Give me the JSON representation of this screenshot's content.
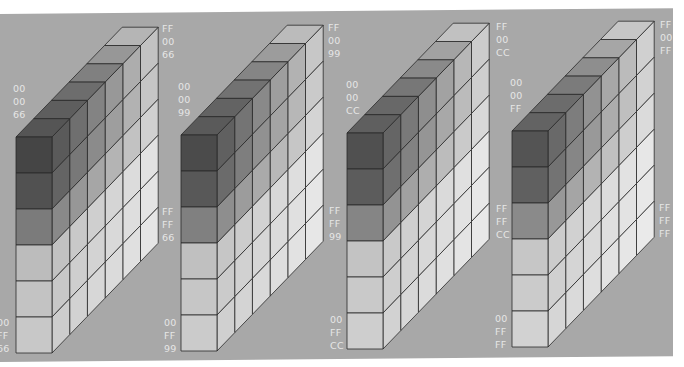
{
  "background_color": "#a8a8a8",
  "line_color": "#2a2a2a",
  "geometry": {
    "cell": 36,
    "rows": 6,
    "depth_steps": 6,
    "dx": 17.7,
    "dy": -18.3
  },
  "cubes": [
    {
      "id": "cube-66",
      "x": 16,
      "bottom": 353,
      "front": [
        "#454545",
        "#515151",
        "#7b7b7b",
        "#bcbcbc",
        "#c3c3c3",
        "#c8c8c8"
      ],
      "top": [
        "#555555",
        "#5e5e5e",
        "#6d6d6d",
        "#808080",
        "#979797",
        "#b5b5b5"
      ],
      "side_fade": 1.0,
      "labels": {
        "top_left": [
          "00",
          "00",
          "66"
        ],
        "top_left_pos": [
          13,
          92
        ],
        "top_right": [
          "FF",
          "00",
          "66"
        ],
        "top_right_pos": [
          162,
          32
        ],
        "mid_right": [
          "FF",
          "FF",
          "66"
        ],
        "mid_right_pos": [
          162,
          215
        ],
        "bottom_left": [
          "00",
          "FF",
          "66"
        ],
        "bottom_left_pos": [
          -3,
          326
        ]
      }
    },
    {
      "id": "cube-99",
      "x": 181,
      "bottom": 351,
      "front": [
        "#4b4b4b",
        "#585858",
        "#808080",
        "#c0c0c0",
        "#c6c6c6",
        "#cbcbcb"
      ],
      "top": [
        "#5a5a5a",
        "#636363",
        "#727272",
        "#858585",
        "#9c9c9c",
        "#bbbbbb"
      ],
      "side_fade": 1.03,
      "labels": {
        "top_left": [
          "00",
          "00",
          "99"
        ],
        "top_left_pos": [
          178,
          90
        ],
        "top_right": [
          "FF",
          "00",
          "99"
        ],
        "top_right_pos": [
          328,
          31
        ],
        "mid_right": [
          "FF",
          "FF",
          "99"
        ],
        "mid_right_pos": [
          329,
          214
        ],
        "bottom_left": [
          "00",
          "FF",
          "99"
        ],
        "bottom_left_pos": [
          164,
          326
        ]
      }
    },
    {
      "id": "cube-cc",
      "x": 347,
      "bottom": 349,
      "front": [
        "#505050",
        "#5c5c5c",
        "#858585",
        "#c3c3c3",
        "#c9c9c9",
        "#cecece"
      ],
      "top": [
        "#5f5f5f",
        "#686868",
        "#777777",
        "#8a8a8a",
        "#a2a2a2",
        "#c1c1c1"
      ],
      "side_fade": 1.06,
      "labels": {
        "top_left": [
          "00",
          "00",
          "CC"
        ],
        "top_left_pos": [
          346,
          88
        ],
        "top_right": [
          "FF",
          "00",
          "CC"
        ],
        "top_right_pos": [
          496,
          30
        ],
        "mid_right": [
          "FF",
          "FF",
          "CC"
        ],
        "mid_right_pos": [
          496,
          212
        ],
        "bottom_left": [
          "00",
          "FF",
          "CC"
        ],
        "bottom_left_pos": [
          330,
          323
        ]
      }
    },
    {
      "id": "cube-ff",
      "x": 512,
      "bottom": 347,
      "front": [
        "#545454",
        "#606060",
        "#8a8a8a",
        "#c6c6c6",
        "#cbcbcb",
        "#d2d2d2"
      ],
      "top": [
        "#636363",
        "#6c6c6c",
        "#7b7b7b",
        "#8e8e8e",
        "#a6a6a6",
        "#c6c6c6"
      ],
      "side_fade": 1.09,
      "labels": {
        "top_left": [
          "00",
          "00",
          "FF"
        ],
        "top_left_pos": [
          510,
          86
        ],
        "top_right": [
          "FF",
          "00",
          "FF"
        ],
        "top_right_pos": [
          660,
          28
        ],
        "mid_right": [
          "FF",
          "FF",
          "FF"
        ],
        "mid_right_pos": [
          659,
          211
        ],
        "bottom_left": [
          "00",
          "FF",
          "FF"
        ],
        "bottom_left_pos": [
          495,
          322
        ]
      }
    }
  ]
}
